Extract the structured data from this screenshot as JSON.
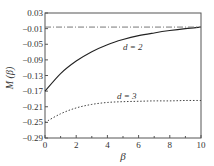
{
  "chart_data": {
    "type": "line",
    "title": "",
    "xlabel": "β",
    "ylabel": "M(β)",
    "xlim": [
      0,
      10
    ],
    "ylim": [
      -0.29,
      0.03
    ],
    "xticks": [
      0,
      2,
      4,
      6,
      8,
      10
    ],
    "yticks": [
      0.03,
      -0.01,
      -0.05,
      -0.09,
      -0.13,
      -0.17,
      -0.21,
      -0.25,
      -0.29
    ],
    "grid": false,
    "series": [
      {
        "name": "d = 2",
        "style": "solid",
        "x": [
          0,
          1,
          2,
          3,
          4,
          5,
          6,
          7,
          8,
          9,
          10
        ],
        "values": [
          -0.17,
          -0.125,
          -0.093,
          -0.069,
          -0.051,
          -0.038,
          -0.028,
          -0.021,
          -0.015,
          -0.01,
          -0.006
        ]
      },
      {
        "name": "d = 3",
        "style": "dotted",
        "x": [
          0,
          1,
          2,
          3,
          4,
          5,
          6,
          7,
          8,
          9,
          10
        ],
        "values": [
          -0.25,
          -0.228,
          -0.213,
          -0.204,
          -0.199,
          -0.197,
          -0.196,
          -0.195,
          -0.195,
          -0.194,
          -0.194
        ]
      },
      {
        "name": "asymptote",
        "style": "dash-dot",
        "x": [
          0,
          10
        ],
        "values": [
          -0.006,
          -0.006
        ]
      }
    ],
    "annotations": [
      {
        "text": "d = 2",
        "x": 5.0,
        "y": -0.043
      },
      {
        "text": "d = 3",
        "x": 4.2,
        "y": -0.187
      }
    ]
  },
  "labels": {
    "xlabel": "β",
    "ylabel": "M (β)",
    "d2": "d = 2",
    "d3": "d = 3",
    "yticks": [
      "0.03",
      "−0.01",
      "−0.05",
      "−0.09",
      "−0.13",
      "−0.17",
      "−0.21",
      "−0.25",
      "−0.29"
    ],
    "xticks": [
      "0",
      "2",
      "4",
      "6",
      "8",
      "10"
    ]
  }
}
